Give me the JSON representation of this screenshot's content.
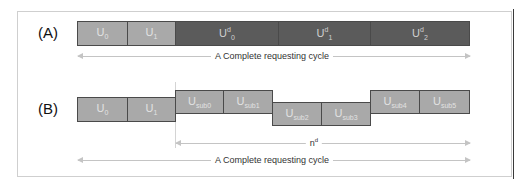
{
  "figure": {
    "row_a": {
      "label": "(A)",
      "cells": [
        {
          "base": "U",
          "sub": "0",
          "sup": "",
          "shade": "light"
        },
        {
          "base": "U",
          "sub": "1",
          "sup": "",
          "shade": "light"
        },
        {
          "base": "U",
          "sub": "0",
          "sup": "d",
          "shade": "dark"
        },
        {
          "base": "U",
          "sub": "1",
          "sup": "d",
          "shade": "dark"
        },
        {
          "base": "U",
          "sub": "2",
          "sup": "d",
          "shade": "dark"
        }
      ],
      "arrow_label": "A Complete requesting cycle"
    },
    "row_b": {
      "label": "(B)",
      "cells": [
        {
          "base": "U",
          "sub": "0",
          "sup": "",
          "shade": "light",
          "level": "mid"
        },
        {
          "base": "U",
          "sub": "1",
          "sup": "",
          "shade": "light",
          "level": "mid"
        },
        {
          "base": "U",
          "sub": "sub0",
          "sup": "",
          "shade": "light",
          "level": "high"
        },
        {
          "base": "U",
          "sub": "sub1",
          "sup": "",
          "shade": "light",
          "level": "high"
        },
        {
          "base": "U",
          "sub": "sub2",
          "sup": "",
          "shade": "light",
          "level": "low"
        },
        {
          "base": "U",
          "sub": "sub3",
          "sup": "",
          "shade": "light",
          "level": "low"
        },
        {
          "base": "U",
          "sub": "sub4",
          "sup": "",
          "shade": "light",
          "level": "high"
        },
        {
          "base": "U",
          "sub": "sub5",
          "sup": "",
          "shade": "light",
          "level": "high"
        }
      ],
      "span_label": {
        "base": "n",
        "sup": "d"
      },
      "arrow_label": "A Complete requesting cycle"
    },
    "colors": {
      "light_cell": "#a9a9a9",
      "dark_cell": "#5b5b5b",
      "cell_border": "#4a4a4a",
      "arrow": "#c4c4c4"
    }
  }
}
